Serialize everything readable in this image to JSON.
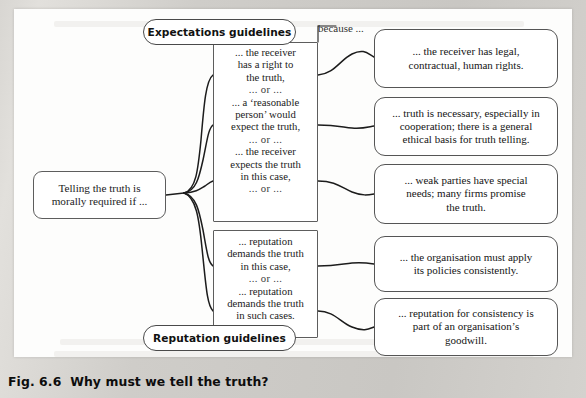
{
  "figure": {
    "caption": "Fig. 6.6  Why must we tell the truth?",
    "because_label": "because ..."
  },
  "root": {
    "text": "Telling the truth is morally required if ..."
  },
  "groups": [
    {
      "pill_label": "Expectations guidelines",
      "pill_position": "top",
      "conditions": [
        "... the receiver has a right to the truth,",
        "... a 'reasonable person' would expect the truth,",
        "... the receiver expects the truth in this case,"
      ],
      "separator": "... or ...",
      "trailing_separator": "... or ..."
    },
    {
      "pill_label": "Reputation guidelines",
      "pill_position": "bottom",
      "conditions": [
        "... reputation demands the truth in  this case,",
        "... reputation demands the truth in such cases."
      ],
      "separator": "... or ...",
      "trailing_separator": ""
    }
  ],
  "expectations_lines": {
    "c1_l1": "... the receiver",
    "c1_l2": "has a right to",
    "c1_l3": "the truth,",
    "or1": "... or ...",
    "c2_l1": "... a ‘reasonable",
    "c2_l2": "person’ would",
    "c2_l3": "expect the truth,",
    "or2": "... or ...",
    "c3_l1": "... the receiver",
    "c3_l2": "expects the truth",
    "c3_l3": "in this case,",
    "or3": "... or ..."
  },
  "reputation_lines": {
    "c1_l1": "... reputation",
    "c1_l2": "demands the truth",
    "c1_l3": "in  this case,",
    "or1": "... or ...",
    "c2_l1": "... reputation",
    "c2_l2": "demands the truth",
    "c2_l3": "in such cases."
  },
  "reasons": [
    {
      "id": "r1",
      "l1": "... the receiver has legal,",
      "l2": "contractual, human rights.",
      "l3": ""
    },
    {
      "id": "r2",
      "l1": "... truth is necessary, especially in",
      "l2": "cooperation; there is a general",
      "l3": "ethical basis for truth telling."
    },
    {
      "id": "r3",
      "l1": "... weak parties have special",
      "l2": "needs; many firms promise",
      "l3": "the truth."
    },
    {
      "id": "r4",
      "l1": "... the organisation must apply",
      "l2": "its policies consistently.",
      "l3": ""
    },
    {
      "id": "r5",
      "l1": "... reputation for consistency is",
      "l2": "part of an organisation’s",
      "l3": "goodwill."
    }
  ],
  "colors": {
    "page_background": "#cfcdc9",
    "figure_background": "#fdfdfc",
    "node_border": "#555555",
    "connector": "#1c1c1c",
    "text": "#151515"
  }
}
